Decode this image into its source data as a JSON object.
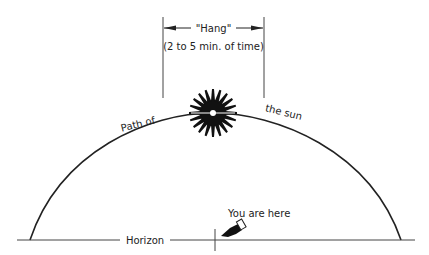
{
  "diagram": {
    "hang_label": "\"Hang\"",
    "hang_sub": "(2 to 5 min. of time)",
    "path_label_left": "Path of",
    "path_label_right": "the  sun",
    "horizon_label": "Horizon",
    "you_label": "You are here",
    "colors": {
      "ink": "#222222",
      "background": "#ffffff"
    }
  }
}
